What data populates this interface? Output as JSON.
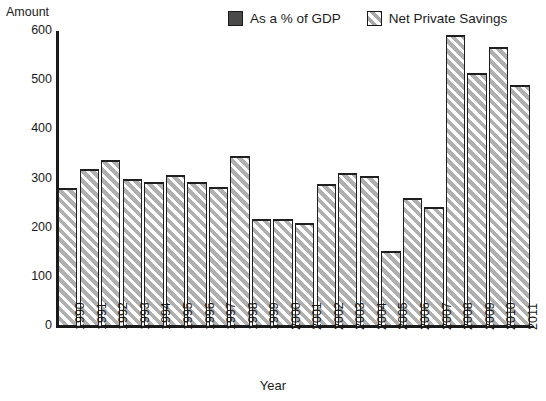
{
  "legend": {
    "position": "top-right",
    "entries": [
      {
        "label": "As a % of GDP",
        "style": "solid-dark",
        "color": "#4a4a4a",
        "icon": "legend-solid-square-icon"
      },
      {
        "label": "Net Private Savings",
        "style": "diagonal-hatch",
        "color": "#a8a8a8",
        "icon": "legend-hatched-square-icon"
      }
    ]
  },
  "axes": {
    "y_title": "Amount",
    "x_title": "Year"
  },
  "chart_data": {
    "type": "bar",
    "title": "",
    "subtitle": "",
    "xlabel": "Year",
    "ylabel": "Amount",
    "ylim": [
      0,
      600
    ],
    "ytick_labels": [
      "600",
      "500",
      "400",
      "300",
      "200",
      "100",
      "0"
    ],
    "ytick_values": [
      600,
      500,
      400,
      300,
      200,
      100,
      0
    ],
    "grid": false,
    "legend_position": "top-right",
    "categories": [
      "1990",
      "1991",
      "1992",
      "1993",
      "1994",
      "1995",
      "1996",
      "1997",
      "1998",
      "1999",
      "2000",
      "2001",
      "2002",
      "2003",
      "2004",
      "2005",
      "2006",
      "2007",
      "2008",
      "2009",
      "2010",
      "2011"
    ],
    "series": [
      {
        "name": "Net Private Savings",
        "values": [
          280,
          320,
          338,
          298,
          293,
          308,
          293,
          283,
          345,
          217,
          217,
          209,
          288,
          311,
          305,
          152,
          261,
          243,
          592,
          515,
          568,
          490
        ]
      }
    ]
  }
}
